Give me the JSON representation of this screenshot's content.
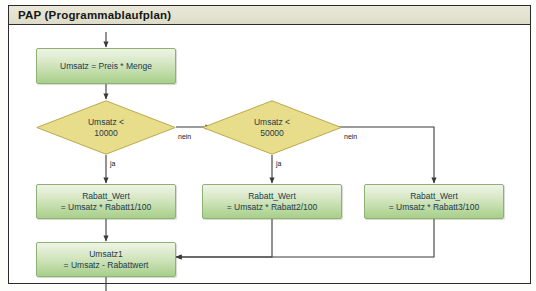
{
  "diagram": {
    "title": "PAP (Programmablaufplan)",
    "nodes": {
      "start_process": {
        "line1": "Umsatz = Preis * Menge",
        "line2": ""
      },
      "decision1": {
        "line1": "Umsatz <",
        "line2": "10000"
      },
      "decision2": {
        "line1": "Umsatz <",
        "line2": "50000"
      },
      "rabatt1": {
        "line1": "Rabatt_Wert",
        "line2": "= Umsatz * Rabatt1/100"
      },
      "rabatt2": {
        "line1": "Rabatt_Wert",
        "line2": "= Umsatz * Rabatt2/100"
      },
      "rabatt3": {
        "line1": "Rabatt_Wert",
        "line2": "= Umsatz * Rabatt3/100"
      },
      "umsatz1": {
        "line1": "Umsatz1",
        "line2": "= Umsatz - Rabattwert"
      }
    },
    "edge_labels": {
      "d1_ja": "ja",
      "d1_nein": "nein",
      "d2_ja": "ja",
      "d2_nein": "nein"
    },
    "colors": {
      "process_fill": "#a8cf8a",
      "process_border": "#8fb274",
      "decision_fill": "#e8dd8a",
      "decision_border": "#b9a94e",
      "title_bar": "#e4e3d1",
      "frame_border": "#2b2b2b",
      "connector": "#3a3a3a",
      "text": "#1d3a4d"
    }
  }
}
